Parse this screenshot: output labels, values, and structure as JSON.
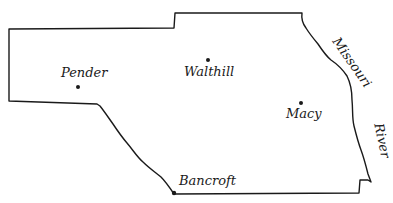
{
  "map": {
    "title": "",
    "towns": [
      {
        "name": "Pender",
        "x": 78,
        "y": 87,
        "label_x": 61,
        "label_y": 67
      },
      {
        "name": "Walthill",
        "x": 208,
        "y": 60,
        "label_x": 184,
        "label_y": 65
      },
      {
        "name": "Macy",
        "x": 301,
        "y": 103,
        "label_x": 286,
        "label_y": 108
      },
      {
        "name": "Bancroft",
        "x": 174,
        "y": 193,
        "label_x": 179,
        "label_y": 174
      }
    ],
    "river": {
      "name_part_1": "Missouri",
      "name_part_2": "River"
    },
    "colors": {
      "line": "#1a1a1a",
      "background": "#ffffff"
    }
  }
}
